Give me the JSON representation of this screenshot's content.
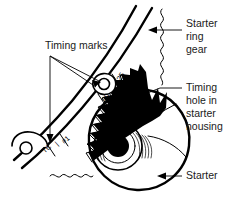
{
  "figure": {
    "background_color": "#ffffff",
    "ink_color": "#000000",
    "label_color": "#1a1a1a"
  },
  "labels": {
    "timing_marks": "Timing marks",
    "starter_ring_gear": [
      "Starter",
      "ring",
      "gear"
    ],
    "starter_ring_gear_line1": "Starter",
    "starter_ring_gear_line2": "ring",
    "starter_ring_gear_line3": "gear",
    "timing_hole": [
      "Timing",
      "hole in",
      "starter",
      "housing"
    ],
    "timing_hole_line1": "Timing",
    "timing_hole_line2": "hole in",
    "timing_hole_line3": "starter",
    "timing_hole_line4": "housing",
    "starter": "Starter"
  },
  "flywheel_scale": {
    "marks": [
      {
        "text": "25",
        "degrees": 25
      },
      {
        "text": "20",
        "degrees": 20
      }
    ],
    "mark_25": "25",
    "mark_20": "20",
    "tdc_mark": "TC",
    "tdc_cylinder": "#1",
    "tdc_separator": "|"
  },
  "icons": {
    "arrow": "arrow-head-icon",
    "break_line": "wavy-break-line-icon",
    "timing_hole_circle": "timing-hole-circle-icon",
    "tdc_hole_circle": "tdc-hole-circle-icon",
    "gear_teeth": "gear-teeth-icon",
    "starter_body": "starter-body-icon",
    "starter_hub": "starter-hub-icon"
  }
}
